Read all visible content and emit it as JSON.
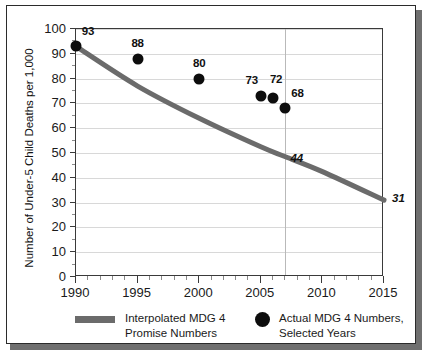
{
  "chart_data": {
    "type": "scatter",
    "title": "",
    "xlabel": "",
    "ylabel": "Number of Under-5 Child Deaths per 1,000",
    "xlim": [
      1990,
      2015
    ],
    "ylim": [
      0,
      100
    ],
    "ytick_step": 10,
    "xtick_step": 5,
    "x_minor_step": 1,
    "grid": "horizontal gridlines plus one vertical reference line at 2007",
    "legend_position": "below plot",
    "yticks": [
      "100",
      "90",
      "80",
      "70",
      "60",
      "50",
      "40",
      "30",
      "20",
      "10",
      "0"
    ],
    "xticks": [
      "1990",
      "1995",
      "2000",
      "2005",
      "2010",
      "2015"
    ],
    "vertical_reference_line": {
      "x": 2007,
      "color": "#b9b9b9"
    },
    "series": [
      {
        "name": "Actual MDG 4 Numbers, Selected Years",
        "type": "scatter",
        "marker": "filled-circle",
        "color": "#0d0d0d",
        "points": [
          {
            "x": 1990,
            "y": 93,
            "label": "93"
          },
          {
            "x": 1995,
            "y": 88,
            "label": "88"
          },
          {
            "x": 2000,
            "y": 80,
            "label": "80"
          },
          {
            "x": 2005,
            "y": 73,
            "label": "73"
          },
          {
            "x": 2006,
            "y": 72,
            "label": "72"
          },
          {
            "x": 2007,
            "y": 68,
            "label": "68"
          }
        ]
      },
      {
        "name": "Interpolated MDG 4 Promise Numbers",
        "type": "line",
        "color": "#6b6b6b",
        "width": 5,
        "annotations": [
          {
            "x": 2007,
            "y": 44,
            "label": "44",
            "style": "italic"
          },
          {
            "x": 2015,
            "y": 31,
            "label": "31",
            "style": "italic"
          }
        ],
        "points": [
          {
            "x": 1990,
            "y": 93
          },
          {
            "x": 1995,
            "y": 77
          },
          {
            "x": 2000,
            "y": 64
          },
          {
            "x": 2005,
            "y": 52.5
          },
          {
            "x": 2007,
            "y": 48.5
          },
          {
            "x": 2010,
            "y": 42.5
          },
          {
            "x": 2015,
            "y": 31
          }
        ]
      }
    ],
    "legend": [
      {
        "marker": "line",
        "label_line_1": "Interpolated MDG 4",
        "label_line_2": "Promise Numbers"
      },
      {
        "marker": "dot",
        "label_line_1": "Actual MDG 4 Numbers,",
        "label_line_2": "Selected Years"
      }
    ]
  }
}
